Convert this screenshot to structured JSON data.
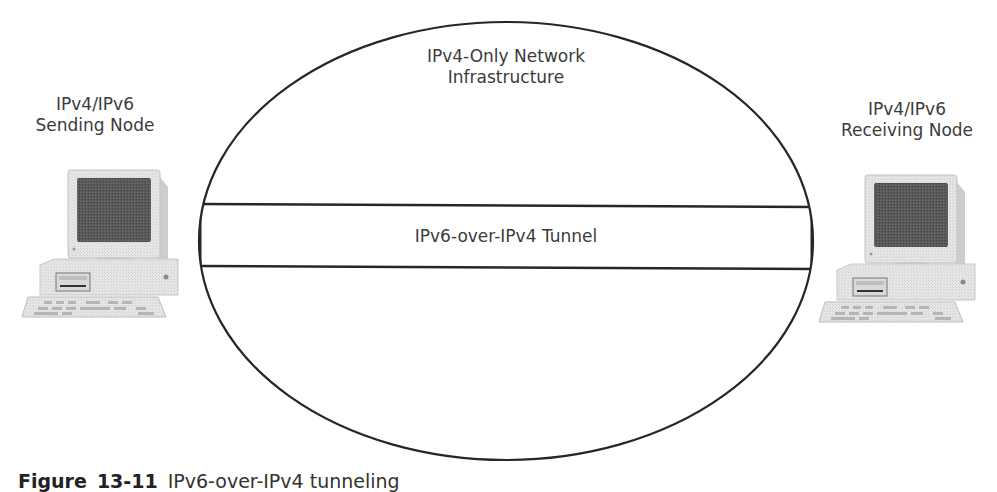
{
  "diagram": {
    "network": {
      "line1": "IPv4-Only Network",
      "line2": "Infrastructure"
    },
    "tunnel": {
      "label": "IPv6-over-IPv4 Tunnel"
    },
    "sender": {
      "line1": "IPv4/IPv6",
      "line2": "Sending Node",
      "icon": "desktop-computer-icon"
    },
    "receiver": {
      "line1": "IPv4/IPv6",
      "line2": "Receiving Node",
      "icon": "desktop-computer-icon"
    },
    "caption": {
      "prefix": "Figure",
      "number": "13-11",
      "text": "IPv6-over-IPv4 tunneling"
    },
    "colors": {
      "stroke": "#262626",
      "text": "#3b3b3b",
      "background": "#ffffff"
    }
  }
}
